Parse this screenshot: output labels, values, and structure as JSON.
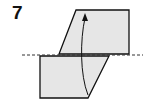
{
  "diagram": {
    "step_number": "7",
    "colors": {
      "paper_fill": "#e6e6e6",
      "outline": "#111111",
      "fold_line": "#333333",
      "background": "#ffffff"
    },
    "elements": [
      {
        "type": "paper-flap-upper",
        "shape": "parallelogram"
      },
      {
        "type": "paper-flap-lower",
        "shape": "trapezoid"
      },
      {
        "type": "valley-fold-line",
        "style": "dashed"
      },
      {
        "type": "fold-arrow",
        "direction": "up"
      }
    ]
  }
}
